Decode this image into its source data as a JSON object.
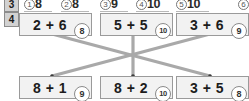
{
  "worksheet": {
    "previous_exercise_number": "3",
    "exercise_number": "4",
    "answer_strip": {
      "items": [
        {
          "marker": "1",
          "value": "8"
        },
        {
          "marker": "2",
          "value": "8"
        },
        {
          "marker": "3",
          "value": "9"
        },
        {
          "marker": "4",
          "value": "10"
        },
        {
          "marker": "5",
          "value": "10"
        },
        {
          "marker": "6",
          "value": ""
        }
      ]
    },
    "top_row": [
      {
        "id": "top-1",
        "equation": "2 + 6",
        "answer": "8"
      },
      {
        "id": "top-2",
        "equation": "5 + 5",
        "answer": "10"
      },
      {
        "id": "top-3",
        "equation": "3 + 6",
        "answer": "9"
      }
    ],
    "bottom_row": [
      {
        "id": "bottom-1",
        "equation": "8 + 1",
        "answer": "9"
      },
      {
        "id": "bottom-2",
        "equation": "8 + 2",
        "answer": "10"
      },
      {
        "id": "bottom-3",
        "equation": "3 + 5",
        "answer": "8"
      }
    ],
    "matches": [
      {
        "from": "top-1",
        "to": "bottom-3"
      },
      {
        "from": "top-2",
        "to": "bottom-2"
      },
      {
        "from": "top-3",
        "to": "bottom-1"
      }
    ],
    "colors": {
      "card_fill": "#f2f2f2",
      "card_border": "#9a9a9a",
      "link_line": "#a9a9a9",
      "badge_fill": "#d2d2d2",
      "text": "#1c1c1c"
    }
  }
}
